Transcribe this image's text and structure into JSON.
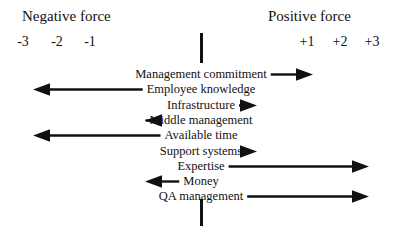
{
  "headers": {
    "negative": "Negative force",
    "positive": "Positive force"
  },
  "scale": {
    "negative_ticks": [
      "-3",
      "-2",
      "-1"
    ],
    "positive_ticks": [
      "+1",
      "+2",
      "+3"
    ]
  },
  "axis": {
    "center_label": "0",
    "line_color": "#111111"
  },
  "chart_data": {
    "type": "bar",
    "title": "",
    "xlabel": "",
    "ylabel": "",
    "xlim": [
      -3,
      3
    ],
    "grid": false,
    "legend": "none",
    "categories": [
      "Management commitment",
      "Employee knowledge",
      "Infrastructure",
      "Middle management",
      "Available time",
      "Support systems",
      "Expertise",
      "Money",
      "QA management"
    ],
    "values": [
      2,
      -3,
      1,
      -1,
      -3,
      1,
      3,
      -1,
      3
    ]
  },
  "rows": [
    {
      "label": "Management commitment",
      "value": 2,
      "direction": "right"
    },
    {
      "label": "Employee knowledge",
      "value": -3,
      "direction": "left"
    },
    {
      "label": "Infrastructure",
      "value": 1,
      "direction": "right"
    },
    {
      "label": "Middle management",
      "value": -1,
      "direction": "left"
    },
    {
      "label": "Available time",
      "value": -3,
      "direction": "left"
    },
    {
      "label": "Support systems",
      "value": 1,
      "direction": "right"
    },
    {
      "label": "Expertise",
      "value": 3,
      "direction": "right"
    },
    {
      "label": "Money",
      "value": -1,
      "direction": "left"
    },
    {
      "label": "QA management",
      "value": 3,
      "direction": "right"
    }
  ]
}
